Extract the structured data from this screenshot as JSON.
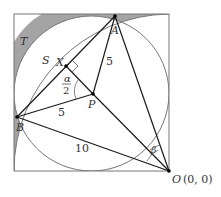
{
  "diagram": {
    "type": "geometry",
    "colors": {
      "square_stroke": "#777777",
      "circle_stroke": "#777777",
      "line_stroke": "#1a1a1a",
      "shaded_fill": "#999999",
      "text": "#333333"
    },
    "points": {
      "A": {
        "label": "A"
      },
      "B": {
        "label": "B"
      },
      "P": {
        "label": "P"
      },
      "X": {
        "label": "X"
      },
      "O": {
        "label": "O",
        "coords": "(0, 0)"
      }
    },
    "regions": {
      "T": {
        "label": "T"
      },
      "S": {
        "label": "S"
      }
    },
    "lengths": {
      "PA": "5",
      "PB": "5",
      "OB": "10"
    },
    "angles": {
      "alpha_half_num": "α",
      "alpha_half_den": "2",
      "beta": "β"
    }
  }
}
